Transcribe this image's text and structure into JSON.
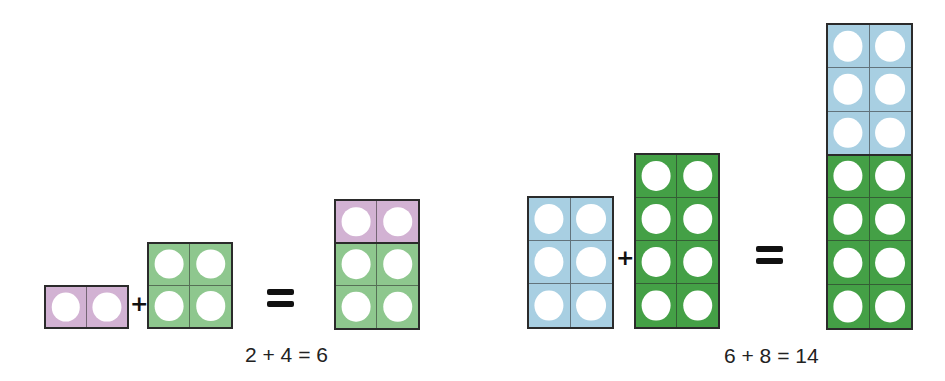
{
  "colors": {
    "pink": "#d2b2d3",
    "light_green": "#8ec78e",
    "light_blue": "#a8cfe2",
    "dark_green": "#44a046",
    "border": "#2b2b2b",
    "hole": "#ffffff"
  },
  "equation1": {
    "addend1": {
      "value": 2,
      "color": "pink",
      "rows": 1,
      "cols": 2
    },
    "plus": "+",
    "addend2": {
      "value": 4,
      "color": "light_green",
      "rows": 2,
      "cols": 2
    },
    "equals": "=",
    "result": {
      "value": 6,
      "segments": [
        {
          "color": "pink",
          "rows": 1
        },
        {
          "color": "light_green",
          "rows": 2
        }
      ]
    },
    "caption": "2 + 4 = 6"
  },
  "equation2": {
    "addend1": {
      "value": 6,
      "color": "light_blue",
      "rows": 3,
      "cols": 2
    },
    "plus": "+",
    "addend2": {
      "value": 8,
      "color": "dark_green",
      "rows": 4,
      "cols": 2
    },
    "equals": "=",
    "result": {
      "value": 14,
      "segments": [
        {
          "color": "light_blue",
          "rows": 3
        },
        {
          "color": "dark_green",
          "rows": 4
        }
      ]
    },
    "caption": "6 + 8 = 14"
  }
}
